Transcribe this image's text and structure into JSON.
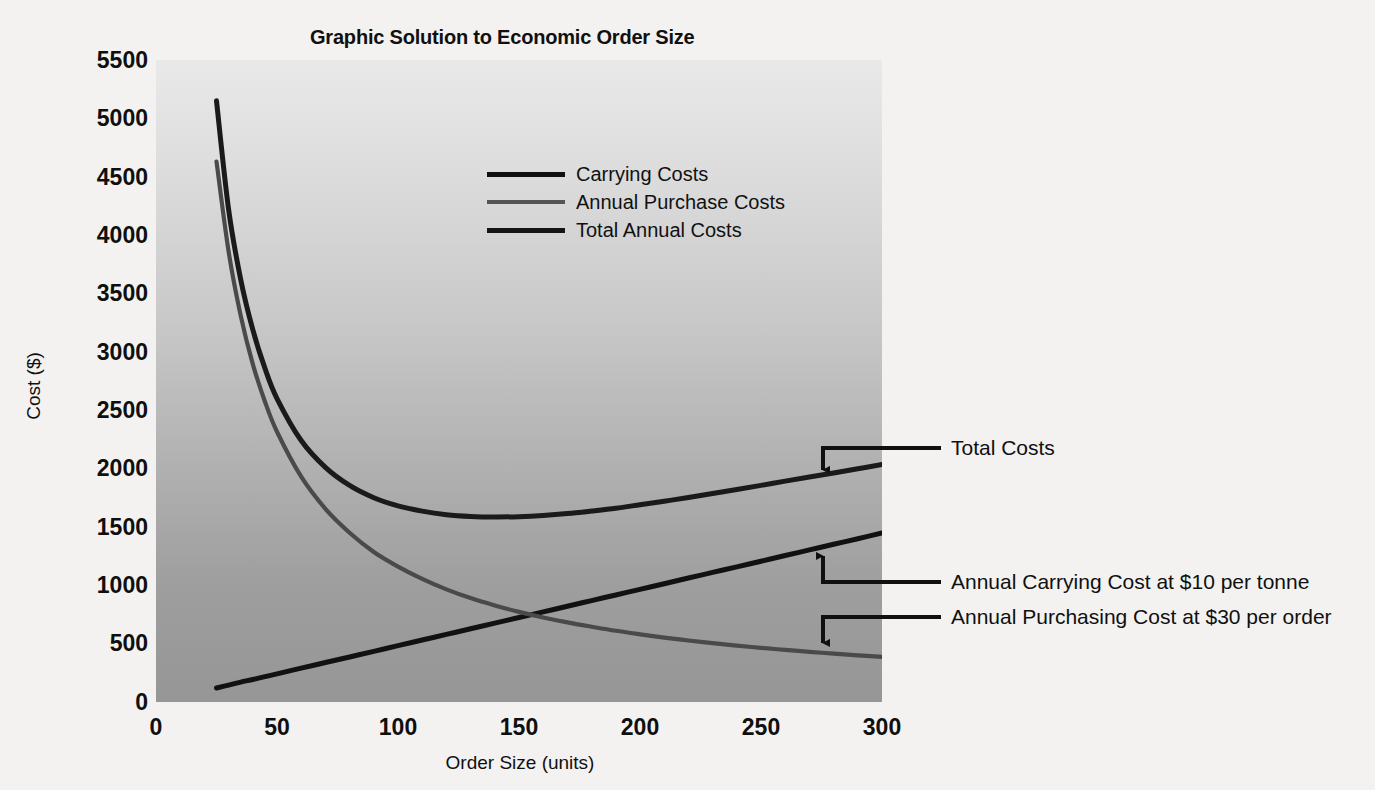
{
  "chart_data": {
    "type": "line",
    "title": "Graphic Solution to Economic Order Size",
    "xlabel": "Order Size (units)",
    "ylabel": "Cost ($)",
    "xlim": [
      0,
      300
    ],
    "ylim": [
      0,
      5500
    ],
    "xticks": [
      0,
      50,
      100,
      150,
      200,
      250,
      300
    ],
    "yticks": [
      0,
      500,
      1000,
      1500,
      2000,
      2500,
      3000,
      3500,
      4000,
      4500,
      5000,
      5500
    ],
    "grid": false,
    "legend_position": "upper-center",
    "x": [
      25,
      30,
      35,
      40,
      45,
      50,
      60,
      70,
      80,
      90,
      100,
      110,
      120,
      130,
      140,
      150,
      160,
      170,
      180,
      190,
      200,
      210,
      220,
      230,
      240,
      250,
      260,
      270,
      280,
      290,
      300
    ],
    "series": [
      {
        "name": "Carrying Costs",
        "color": "#111111",
        "values": [
          120,
          145,
          170,
          193,
          217,
          241,
          290,
          338,
          386,
          434,
          483,
          531,
          579,
          627,
          676,
          724,
          772,
          820,
          869,
          917,
          965,
          1013,
          1062,
          1110,
          1158,
          1206,
          1255,
          1303,
          1351,
          1399,
          1448
        ]
      },
      {
        "name": "Annual Purchase Costs",
        "color": "#4a4a4a",
        "values": [
          4630,
          3860,
          3310,
          2895,
          2575,
          2315,
          1930,
          1655,
          1450,
          1285,
          1160,
          1055,
          965,
          890,
          827,
          772,
          724,
          682,
          645,
          610,
          580,
          552,
          527,
          504,
          483,
          464,
          446,
          430,
          414,
          400,
          387
        ]
      },
      {
        "name": "Total Annual Costs",
        "color": "#1a1a1a",
        "values": [
          5150,
          4220,
          3620,
          3190,
          2860,
          2600,
          2240,
          2010,
          1855,
          1750,
          1680,
          1635,
          1605,
          1590,
          1585,
          1588,
          1598,
          1614,
          1636,
          1660,
          1690,
          1720,
          1752,
          1786,
          1820,
          1856,
          1892,
          1928,
          1962,
          1998,
          2035
        ]
      }
    ],
    "annotations": [
      {
        "id": "total-costs",
        "label": "Total Costs",
        "arrow": "down",
        "target_x": 272,
        "target_y": 1830
      },
      {
        "id": "carrying-cost",
        "label": "Annual Carrying Cost at $10 per tonne",
        "arrow": "up",
        "target_x": 272,
        "target_y": 1390
      },
      {
        "id": "purchasing-cost",
        "label": "Annual Purchasing Cost at $30 per order",
        "arrow": "down",
        "target_x": 272,
        "target_y": 500
      }
    ]
  },
  "legend": {
    "items": [
      {
        "label": "Carrying Costs",
        "color": "#111111",
        "width": "5px"
      },
      {
        "label": "Annual Purchase Costs",
        "color": "#555555",
        "width": "4px"
      },
      {
        "label": "Total Annual Costs",
        "color": "#141414",
        "width": "5px"
      }
    ]
  },
  "axes": {
    "y_tick_labels": [
      "5500",
      "5000",
      "4500",
      "4000",
      "3500",
      "3000",
      "2500",
      "2000",
      "1500",
      "1000",
      "500",
      "0"
    ],
    "x_tick_labels": [
      "0",
      "50",
      "100",
      "150",
      "200",
      "250",
      "300"
    ]
  },
  "colors": {
    "plot_bg_top": "#e9e9e9",
    "plot_bg_bottom": "#969696",
    "page_bg": "#f3f2f0",
    "ink": "#101010"
  }
}
